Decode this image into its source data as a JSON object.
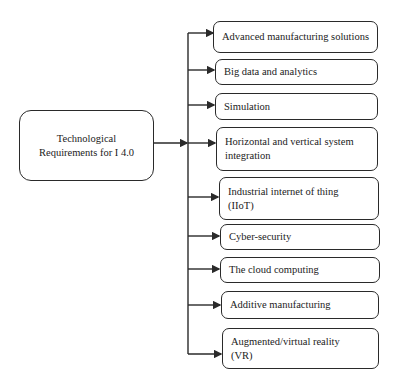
{
  "root": {
    "label_line1": "Technological",
    "label_line2": "Requirements for I 4.0"
  },
  "items": [
    {
      "label": "Advanced manufacturing solutions"
    },
    {
      "label": "Big data and analytics"
    },
    {
      "label": "Simulation"
    },
    {
      "label_line1": "Horizontal and vertical system",
      "label_line2": "integration"
    },
    {
      "label_line1": "Industrial internet of thing",
      "label_line2": "(IIoT)"
    },
    {
      "label": "Cyber-security"
    },
    {
      "label": "The cloud computing"
    },
    {
      "label": "Additive manufacturing"
    },
    {
      "label_line1": "Augmented/virtual reality",
      "label_line2": "(VR)"
    }
  ],
  "colors": {
    "line": "#2a2a2a",
    "background": "#ffffff"
  }
}
